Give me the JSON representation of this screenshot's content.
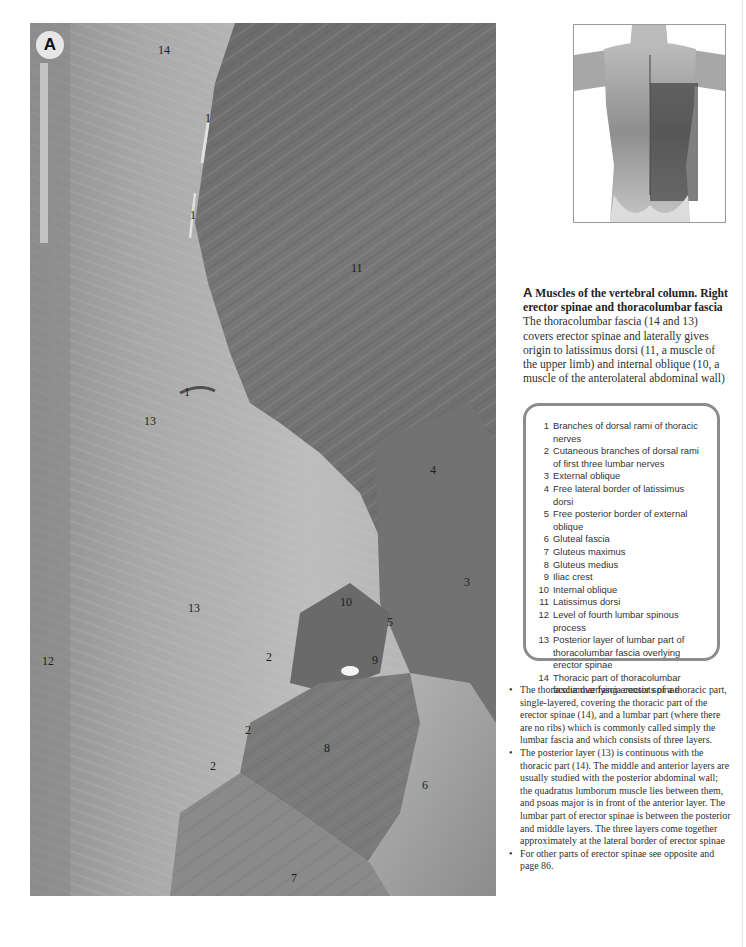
{
  "figure": {
    "panel_letter": "A",
    "labels": [
      {
        "id": "label-14-top",
        "text": "14"
      },
      {
        "id": "label-1-a",
        "text": "1"
      },
      {
        "id": "label-1-b",
        "text": "1"
      },
      {
        "id": "label-11",
        "text": "11"
      },
      {
        "id": "label-1-c",
        "text": "1"
      },
      {
        "id": "label-13-a",
        "text": "13"
      },
      {
        "id": "label-4",
        "text": "4"
      },
      {
        "id": "label-3",
        "text": "3"
      },
      {
        "id": "label-10",
        "text": "10"
      },
      {
        "id": "label-5",
        "text": "5"
      },
      {
        "id": "label-13-b",
        "text": "13"
      },
      {
        "id": "label-12",
        "text": "12"
      },
      {
        "id": "label-2-a",
        "text": "2"
      },
      {
        "id": "label-9",
        "text": "9"
      },
      {
        "id": "label-2-b",
        "text": "2"
      },
      {
        "id": "label-8",
        "text": "8"
      },
      {
        "id": "label-2-c",
        "text": "2"
      },
      {
        "id": "label-6",
        "text": "6"
      },
      {
        "id": "label-7",
        "text": "7"
      }
    ]
  },
  "caption": {
    "letter": "A",
    "title": "Muscles of the vertebral column. Right erector spinae and thoracolumbar fascia",
    "body": "The thoracolumbar fascia (14 and 13) covers erector spinae and laterally gives origin to latissimus dorsi (11, a muscle of the upper limb) and internal oblique (10, a muscle of the anterolateral abdominal wall)"
  },
  "legend": [
    {
      "num": "1",
      "text": "Branches of dorsal rami of thoracic nerves"
    },
    {
      "num": "2",
      "text": "Cutaneous branches of dorsal rami of first three lumbar nerves"
    },
    {
      "num": "3",
      "text": "External oblique"
    },
    {
      "num": "4",
      "text": "Free lateral border of latissimus dorsi"
    },
    {
      "num": "5",
      "text": "Free posterior border of external oblique"
    },
    {
      "num": "6",
      "text": "Gluteal fascia"
    },
    {
      "num": "7",
      "text": "Gluteus maximus"
    },
    {
      "num": "8",
      "text": "Gluteus medius"
    },
    {
      "num": "9",
      "text": "Iliac crest"
    },
    {
      "num": "10",
      "text": "Internal oblique"
    },
    {
      "num": "11",
      "text": "Latissimus dorsi"
    },
    {
      "num": "12",
      "text": "Level of fourth lumbar spinous process"
    },
    {
      "num": "13",
      "text": "Posterior layer of lumbar part of thoracolumbar fascia overlying erector spinae"
    },
    {
      "num": "14",
      "text": "Thoracic part of thoracolumbar fascia overlying erector spinae"
    }
  ],
  "notes": {
    "bullet": "•",
    "items": [
      "The thoracolumbar fascia consists of a thoracic part, single-layered, covering the thoracic part of the erector spinae (14), and a lumbar part (where there are no ribs) which is commonly called simply the lumbar fascia and which consists of three layers.",
      "The posterior layer (13) is continuous with the thoracic part (14). The middle and anterior layers are usually studied with the posterior abdominal wall; the quadratus lumborum muscle lies between them, and psoas major is in front of the anterior layer. The lumbar part of erector spinae is between the posterior and middle layers. The three layers come together approximately at the lateral border of erector spinae",
      "For other parts of erector spinae see opposite and page 86."
    ]
  },
  "colors": {
    "fascia": "#b4b4b4",
    "muscle": "#6f6f6f",
    "legend_border": "#8c8c8c",
    "text": "#2f2f2f"
  }
}
